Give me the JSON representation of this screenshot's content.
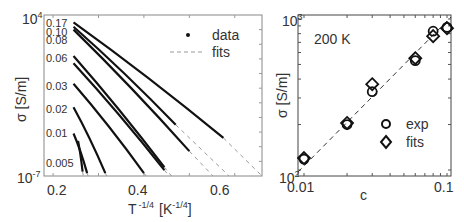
{
  "chart_data": [
    {
      "type": "line",
      "panel": "left",
      "xlabel": "T^-1/4 [K^-1/4]",
      "xlabel_main": "T",
      "xlabel_sup": "-1/4",
      "xlabel_unit_open": "[K",
      "xlabel_unit_sup": "-1/4",
      "xlabel_unit_close": "]",
      "ylabel": "σ [S/m]",
      "yscale": "log",
      "xlim": [
        0.18,
        0.66
      ],
      "ylim_exp": [
        -7,
        4
      ],
      "xticks": [
        "0.2",
        "0.4",
        "0.6"
      ],
      "ytick_top": {
        "base": "10",
        "exp": "4"
      },
      "ytick_bottom": {
        "base": "10",
        "exp": "-7"
      },
      "legend": [
        {
          "marker": "dot",
          "label": "data"
        },
        {
          "marker": "dashed",
          "label": "fits"
        }
      ],
      "series_labels": [
        "0.17",
        "0.10",
        "0.08",
        "0.06",
        "0.03",
        "0.02",
        "0.01",
        "0.005"
      ],
      "series": [
        {
          "name": "0.17",
          "x_start": 0.245,
          "x_end": 0.575,
          "logy_start": 3.5,
          "logy_end": -4.4
        },
        {
          "name": "0.10",
          "x_start": 0.245,
          "x_end": 0.47,
          "logy_start": 3.2,
          "logy_end": -3.5
        },
        {
          "name": "0.08",
          "x_start": 0.245,
          "x_end": 0.5,
          "logy_start": 3.0,
          "logy_end": -5.3
        },
        {
          "name": "0.06",
          "x_start": 0.245,
          "x_end": 0.445,
          "logy_start": 1.2,
          "logy_end": -6.4
        },
        {
          "name": "0.06b",
          "x_start": 0.245,
          "x_end": 0.445,
          "logy_start": 0.7,
          "logy_end": -6.6
        },
        {
          "name": "0.03",
          "x_start": 0.245,
          "x_end": 0.4,
          "logy_start": -0.7,
          "logy_end": -6.8
        },
        {
          "name": "0.02",
          "x_start": 0.245,
          "x_end": 0.315,
          "logy_start": -2.3,
          "logy_end": -6.8
        },
        {
          "name": "0.01",
          "x_start": 0.245,
          "x_end": 0.275,
          "logy_start": -4.1,
          "logy_end": -6.8
        },
        {
          "name": "0.005",
          "x_start": 0.255,
          "x_end": 0.265,
          "logy_start": -4.6,
          "logy_end": -6.7
        }
      ]
    },
    {
      "type": "scatter",
      "panel": "right",
      "annotation": "200 K",
      "xlabel": "c",
      "ylabel": "σ [S/m]",
      "xscale": "log",
      "yscale": "log",
      "xlim": [
        0.01,
        0.1
      ],
      "ylim": [
        100,
        1000
      ],
      "xticks": [
        "0.01",
        "0.1"
      ],
      "ytick_top": {
        "base": "10",
        "exp": "3"
      },
      "ytick_bottom": {
        "base": "10",
        "exp": "2"
      },
      "legend": [
        {
          "marker": "circle",
          "label": "exp"
        },
        {
          "marker": "diamond",
          "label": "fits"
        }
      ],
      "series": [
        {
          "name": "exp",
          "x": [
            0.01,
            0.02,
            0.03,
            0.06,
            0.08,
            0.1
          ],
          "y": [
            118,
            200,
            330,
            530,
            830,
            880
          ]
        },
        {
          "name": "fits",
          "x": [
            0.01,
            0.02,
            0.03,
            0.06,
            0.08,
            0.1
          ],
          "y": [
            120,
            205,
            370,
            550,
            770,
            870
          ]
        }
      ],
      "fit_line": "dashed, slope ≈ 1 in log-log"
    }
  ]
}
